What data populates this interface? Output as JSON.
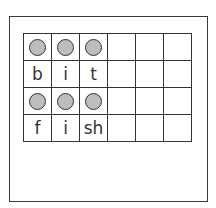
{
  "worksheet": {
    "title": "",
    "grid": {
      "columns": 6,
      "rows": [
        {
          "type": "dots",
          "count": 3
        },
        {
          "type": "letters",
          "cells": [
            "b",
            "i",
            "t"
          ]
        },
        {
          "type": "dots",
          "count": 3
        },
        {
          "type": "letters",
          "cells": [
            "f",
            "i",
            "sh"
          ]
        }
      ]
    },
    "colors": {
      "dot_fill": "#bdbdbd",
      "line": "#333333"
    }
  }
}
